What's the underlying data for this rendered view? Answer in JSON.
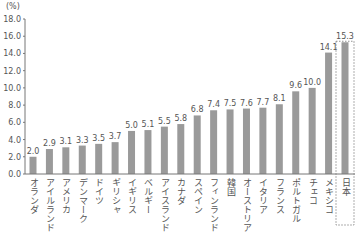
{
  "chart_data": {
    "type": "bar",
    "title": "",
    "xlabel": "",
    "ylabel": "(%)",
    "ylim": [
      0,
      18
    ],
    "yticks": [
      "0.0",
      "2.0",
      "4.0",
      "6.0",
      "8.0",
      "10.0",
      "12.0",
      "14.0",
      "16.0",
      "18.0"
    ],
    "grid": false,
    "categories": [
      "オランダ",
      "アイルランド",
      "アメリカ",
      "デンマーク",
      "ドイツ",
      "ギリシャ",
      "イギリス",
      "ベルギー",
      "アイスランド",
      "カナダ",
      "スペイン",
      "フィンランド",
      "韓国",
      "オーストリア",
      "イタリア",
      "フランス",
      "ポルトガル",
      "チェコ",
      "メキシコ",
      "日本"
    ],
    "values": [
      2.0,
      2.9,
      3.1,
      3.3,
      3.5,
      3.7,
      5.0,
      5.1,
      5.5,
      5.8,
      6.8,
      7.4,
      7.5,
      7.6,
      7.7,
      8.1,
      9.6,
      10.0,
      14.1,
      15.3
    ],
    "value_labels": [
      "2.0",
      "2.9",
      "3.1",
      "3.3",
      "3.5",
      "3.7",
      "5.0",
      "5.1",
      "5.5",
      "5.8",
      "6.8",
      "7.4",
      "7.5",
      "7.6",
      "7.7",
      "8.1",
      "9.6",
      "10.0",
      "14.1",
      "15.3"
    ],
    "highlight": "日本",
    "bar_color": "#9a9a9a",
    "axis_color": "#777777"
  }
}
